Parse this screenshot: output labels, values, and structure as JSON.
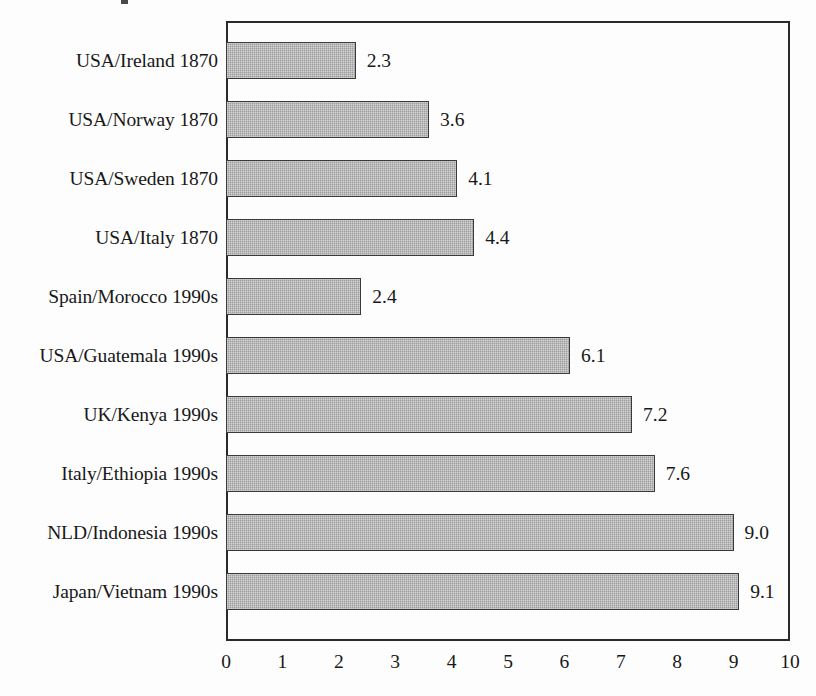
{
  "chart_data": {
    "type": "bar",
    "orientation": "horizontal",
    "title": "",
    "xlabel": "",
    "ylabel": "",
    "xlim": [
      0,
      10
    ],
    "xticks": [
      "0",
      "1",
      "2",
      "3",
      "4",
      "5",
      "6",
      "7",
      "8",
      "9",
      "10"
    ],
    "grid": false,
    "legend": null,
    "bar_color": "#9d9d9d",
    "bar_edge_color": "#3a3a3a",
    "frame_color": "#2a2a2a",
    "background_color": "#fdfdfd",
    "categories": [
      "USA/Ireland 1870",
      "USA/Norway 1870",
      "USA/Sweden 1870",
      "USA/Italy 1870",
      "Spain/Morocco 1990s",
      "USA/Guatemala 1990s",
      "UK/Kenya 1990s",
      "Italy/Ethiopia 1990s",
      "NLD/Indonesia 1990s",
      "Japan/Vietnam 1990s"
    ],
    "values": [
      2.3,
      3.6,
      4.1,
      4.4,
      2.4,
      6.1,
      7.2,
      7.6,
      9.0,
      9.1
    ],
    "value_labels": [
      "2.3",
      "3.6",
      "4.1",
      "4.4",
      "2.4",
      "6.1",
      "7.2",
      "7.6",
      "9.0",
      "9.1"
    ]
  }
}
